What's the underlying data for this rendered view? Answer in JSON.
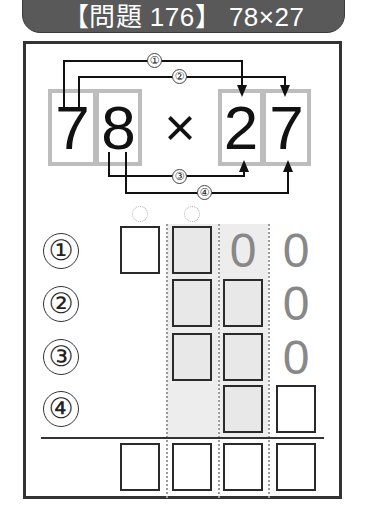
{
  "header": {
    "title": "【問題 176】 78×27"
  },
  "problem": {
    "multiplicand": [
      "7",
      "8"
    ],
    "operator": "×",
    "multiplier": [
      "2",
      "7"
    ],
    "arrow_labels": [
      "①",
      "②",
      "③",
      "④"
    ]
  },
  "rows": [
    {
      "label": "①",
      "known_digits": [
        "0",
        "0"
      ]
    },
    {
      "label": "②",
      "known_digits": [
        "0"
      ]
    },
    {
      "label": "③",
      "known_digits": [
        "0"
      ]
    },
    {
      "label": "④",
      "known_digits": []
    }
  ],
  "colors": {
    "header_bg": "#595959",
    "shade": "#ededed",
    "zero": "#888888"
  }
}
